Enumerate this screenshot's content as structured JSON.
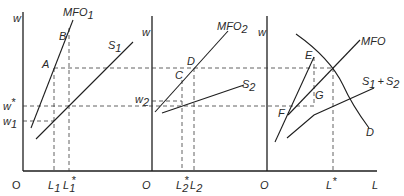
{
  "diagram": {
    "panels": [
      {
        "id": "panel-1",
        "y_axis_label": "w",
        "origin_label": "O",
        "curves": [
          {
            "name": "MFO",
            "sub": "1"
          },
          {
            "name": "S",
            "sub": "1"
          }
        ],
        "points": [
          "A",
          "B"
        ],
        "wage_labels": [
          {
            "main": "w",
            "sup": "*"
          },
          {
            "main": "w",
            "sub": "1"
          }
        ],
        "x_ticks": [
          {
            "main": "L",
            "sub": "1"
          },
          {
            "main": "L",
            "sub": "1",
            "sup": "*"
          }
        ]
      },
      {
        "id": "panel-2",
        "y_axis_label": "w",
        "origin_label": "O",
        "curves": [
          {
            "name": "MFO",
            "sub": "2"
          },
          {
            "name": "S",
            "sub": "2"
          }
        ],
        "points": [
          "C",
          "D"
        ],
        "wage_labels": [
          {
            "main": "w",
            "sub": "2"
          }
        ],
        "x_ticks": [
          {
            "main": "L",
            "sub": "2",
            "sup": "*"
          },
          {
            "main": "L",
            "sub": "2"
          }
        ]
      },
      {
        "id": "panel-3",
        "y_axis_label": "w",
        "origin_label": "O",
        "x_axis_label": "L",
        "curves": [
          {
            "name": "MFO"
          },
          {
            "name": "S1+S2",
            "label": "S₁ + S₂"
          },
          {
            "name": "D"
          }
        ],
        "points": [
          "E",
          "F",
          "G"
        ],
        "x_ticks": [
          {
            "main": "L",
            "sup": "*"
          }
        ]
      }
    ]
  },
  "labels": {
    "w": "w",
    "O": "O",
    "L": "L",
    "MFO": "MFO",
    "S": "S",
    "A": "A",
    "B": "B",
    "C": "C",
    "D": "D",
    "E": "E",
    "F": "F",
    "G": "G",
    "D_curve": "D",
    "sub1": "1",
    "sub2": "2",
    "star": "*",
    "plus": "+"
  }
}
